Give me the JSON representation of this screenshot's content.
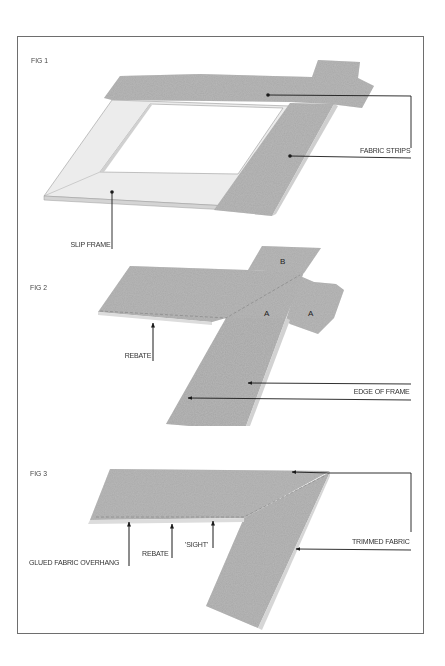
{
  "figures": [
    {
      "label": "FIG 1",
      "callouts": [
        {
          "text": "FABRIC STRIPS",
          "targets": [
            "top fabric strip",
            "right fabric strip"
          ]
        },
        {
          "text": "SLIP FRAME",
          "targets": [
            "slip frame bottom rail"
          ]
        }
      ]
    },
    {
      "label": "FIG 2",
      "corner_letters": [
        "B",
        "A",
        "A"
      ],
      "callouts": [
        {
          "text": "REBATE"
        },
        {
          "text": "EDGE OF FRAME",
          "arrows": 2
        }
      ]
    },
    {
      "label": "FIG 3",
      "callouts": [
        {
          "text": "GLUED FABRIC OVERHANG"
        },
        {
          "text": "REBATE"
        },
        {
          "text": "'SIGHT'"
        },
        {
          "text": "TRIMMED FABRIC",
          "arrows": 2
        }
      ]
    }
  ],
  "colors": {
    "fabric": "#a8a8a8",
    "fabric_light": "#c4c4c4",
    "frame_wood": "#ececec",
    "frame_edge": "#cfcfcf",
    "line": "#1a1a1a",
    "border": "#6e6e6e"
  }
}
